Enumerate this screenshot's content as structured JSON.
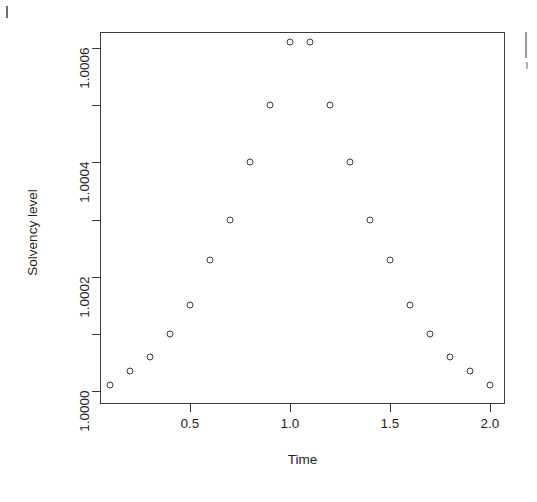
{
  "chart_data": {
    "type": "scatter",
    "title": "",
    "xlabel": "Time",
    "ylabel": "Solvency level",
    "xlim": [
      0.0,
      2.05
    ],
    "ylim": [
      0.999995,
      1.000625
    ],
    "grid": false,
    "legend": null,
    "marker": "open-circle",
    "x": [
      0.1,
      0.2,
      0.3,
      0.4,
      0.5,
      0.6,
      0.7,
      0.8,
      0.9,
      1.0,
      1.1,
      1.2,
      1.3,
      1.4,
      1.5,
      1.6,
      1.7,
      1.8,
      1.9,
      2.0
    ],
    "y": [
      1.00001,
      1.000035,
      1.00006,
      1.0001,
      1.00015,
      1.00023,
      1.0003,
      1.0004,
      1.0005,
      1.00061,
      1.00061,
      1.0005,
      1.0004,
      1.0003,
      1.00023,
      1.00015,
      1.0001,
      1.00006,
      1.000035,
      1.00001
    ],
    "xticks": [
      {
        "value": 0.5,
        "label": "0.5"
      },
      {
        "value": 1.0,
        "label": "1.0"
      },
      {
        "value": 1.5,
        "label": "1.5"
      },
      {
        "value": 2.0,
        "label": "2.0"
      }
    ],
    "yticks": [
      {
        "value": 1.0,
        "label": "1.0000"
      },
      {
        "value": 1.0001,
        "label": ""
      },
      {
        "value": 1.0002,
        "label": "1.0002"
      },
      {
        "value": 1.0003,
        "label": ""
      },
      {
        "value": 1.0004,
        "label": "1.0004"
      },
      {
        "value": 1.0005,
        "label": ""
      },
      {
        "value": 1.0006,
        "label": "1.0006"
      }
    ]
  },
  "axes": {
    "x_title": "Time",
    "y_title": "Solvency level"
  }
}
